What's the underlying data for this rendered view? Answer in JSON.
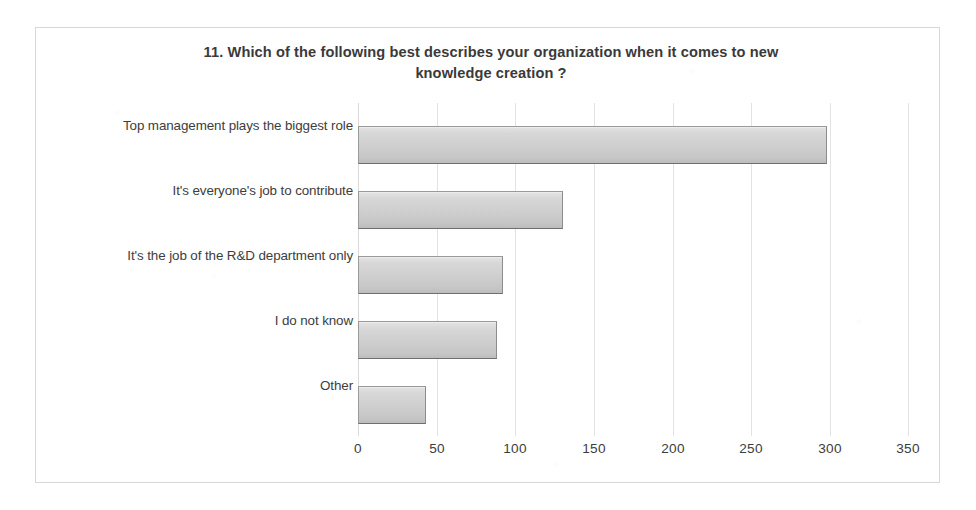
{
  "frame": {
    "border_color": "#d8d8d8"
  },
  "chart_data": {
    "type": "bar",
    "orientation": "horizontal",
    "title": "11. Which of the following  best describes  your organization  when it comes to new knowledge  creation  ?",
    "title_line1": "11. Which of the following  best describes  your organization  when it comes to new",
    "title_line2": "knowledge  creation  ?",
    "xlabel": "",
    "ylabel": "",
    "categories": [
      "Top management  plays the biggest role",
      "It's everyone's job to contribute",
      "It's the job of the R&D department only",
      "I do not know",
      "Other"
    ],
    "values": [
      298,
      130,
      92,
      88,
      43
    ],
    "xlim": [
      0,
      350
    ],
    "xticks": [
      0,
      50,
      100,
      150,
      200,
      250,
      300,
      350
    ],
    "xtick_labels": [
      "0",
      "50",
      "100",
      "150",
      "200",
      "250",
      "300",
      "350"
    ],
    "grid": true,
    "grid_axis": "x",
    "grid_color": "#e3e3e3",
    "legend": false,
    "bar_fill_top": "#e3e3e3",
    "bar_fill_bottom": "#bdbdbd",
    "bar_border": "#9a9a9a",
    "text_color": "#3d3d3d"
  }
}
